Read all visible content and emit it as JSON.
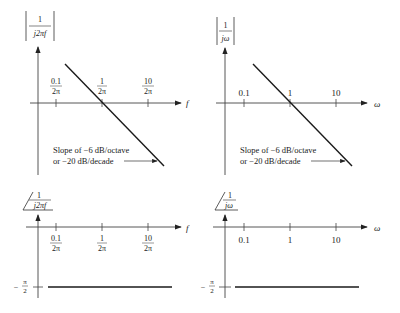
{
  "panels": {
    "mag_f": {
      "ylabel_num": "1",
      "ylabel_den": "j2πf",
      "xlabel": "f",
      "ticks": [
        {
          "num": "0.1",
          "den": "2π"
        },
        {
          "num": "1",
          "den": "2π"
        },
        {
          "num": "10",
          "den": "2π"
        }
      ],
      "note_line1": "Slope of −6 dB/octave",
      "note_line2": "or −20 dB/decade"
    },
    "mag_w": {
      "ylabel_num": "1",
      "ylabel_den": "jω",
      "xlabel": "ω",
      "ticks": [
        "0.1",
        "1",
        "10"
      ],
      "note_line1": "Slope of −6 dB/octave",
      "note_line2": "or −20 dB/decade"
    },
    "phase_f": {
      "ylabel_num": "1",
      "ylabel_den": "j2πf",
      "xlabel": "f",
      "ticks": [
        {
          "num": "0.1",
          "den": "2π"
        },
        {
          "num": "1",
          "den": "2π"
        },
        {
          "num": "10",
          "den": "2π"
        }
      ],
      "level_num": "π",
      "level_den": "2",
      "level_sign": "−"
    },
    "phase_w": {
      "ylabel_num": "1",
      "ylabel_den": "jω",
      "xlabel": "ω",
      "ticks": [
        "0.1",
        "1",
        "10"
      ],
      "level_num": "π",
      "level_den": "2",
      "level_sign": "−"
    }
  },
  "colors": {
    "line": "#1a1a1a",
    "axis": "#444444"
  }
}
